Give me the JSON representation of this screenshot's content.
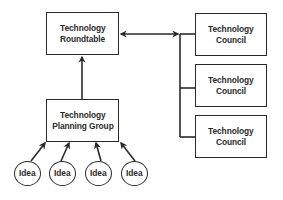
{
  "diagram": {
    "type": "org-flow",
    "nodes": {
      "roundtable": {
        "line1": "Technology",
        "line2": "Roundtable"
      },
      "planning": {
        "line1": "Technology",
        "line2": "Planning Group"
      },
      "councils": [
        {
          "line1": "Technology",
          "line2": "Council"
        },
        {
          "line1": "Technology",
          "line2": "Council"
        },
        {
          "line1": "Technology",
          "line2": "Council"
        }
      ],
      "ideas": [
        {
          "label": "Idea"
        },
        {
          "label": "Idea"
        },
        {
          "label": "Idea"
        },
        {
          "label": "Idea"
        }
      ]
    },
    "edges": [
      {
        "from": "planning",
        "to": "roundtable",
        "direction": "one-way"
      },
      {
        "from": "roundtable",
        "to": "councils",
        "direction": "two-way"
      },
      {
        "from": "ideas[0]",
        "to": "planning",
        "direction": "one-way"
      },
      {
        "from": "ideas[1]",
        "to": "planning",
        "direction": "one-way"
      },
      {
        "from": "ideas[2]",
        "to": "planning",
        "direction": "one-way"
      },
      {
        "from": "ideas[3]",
        "to": "planning",
        "direction": "one-way"
      }
    ],
    "colors": {
      "line": "#2a2a2a",
      "background": "#ffffff"
    }
  }
}
